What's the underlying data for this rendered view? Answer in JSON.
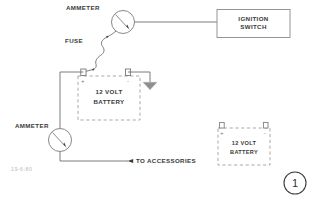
{
  "figure": {
    "number": "1",
    "code": "19-6-80"
  },
  "labels": {
    "ammeter_top": "AMMETER",
    "ammeter_bottom": "AMMETER",
    "fuse": "FUSE",
    "to_accessories": "TO ACCESSORIES"
  },
  "components": {
    "ignition_switch": {
      "line1": "IGNITION",
      "line2": "SWITCH"
    },
    "battery_main": {
      "line1": "12 VOLT",
      "line2": "BATTERY",
      "positive": "+",
      "negative": "-"
    },
    "battery_secondary": {
      "line1": "12 VOLT",
      "line2": "BATTERY",
      "positive": "+",
      "negative": "-"
    },
    "ground": "ground-symbol"
  },
  "colors": {
    "background": "#ffffff",
    "wire": "#6e6e6e",
    "wire_dark": "#4a4a4a",
    "dashed": "#9a9a9a",
    "text": "#3a3a3a",
    "faint_text": "#b9b9b9"
  }
}
